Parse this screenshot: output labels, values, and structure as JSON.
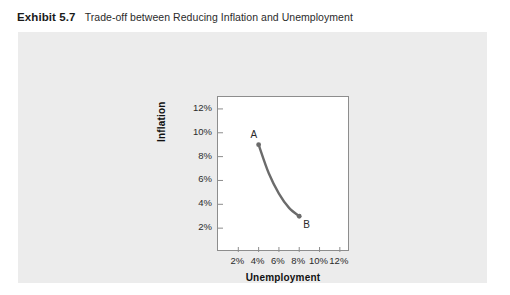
{
  "exhibit": {
    "label": "Exhibit 5.7",
    "caption": "Trade-off between Reducing Inflation and Unemployment"
  },
  "colors": {
    "panel_background": "#ececec",
    "plot_background": "#ffffff",
    "frame": "#8d8d8d",
    "curve": "#6b6b6b",
    "text": "#2b2b2b"
  },
  "chart_data": {
    "type": "line",
    "title": "",
    "subtitle": "",
    "xlabel": "Unemployment",
    "ylabel": "Inflation",
    "xlim": [
      0,
      13
    ],
    "ylim": [
      0,
      13
    ],
    "xticks": [
      2,
      4,
      6,
      8,
      10,
      12
    ],
    "xtick_labels": [
      "2%",
      "4%",
      "6%",
      "8%",
      "10%",
      "12%"
    ],
    "yticks": [
      2,
      4,
      6,
      8,
      10,
      12
    ],
    "ytick_labels": [
      "2%",
      "4%",
      "6%",
      "8%",
      "10%",
      "12%"
    ],
    "grid": false,
    "legend": "none",
    "series": [
      {
        "name": "Phillips curve",
        "color": "#6b6b6b",
        "x": [
          4,
          5,
          6,
          7,
          8
        ],
        "y": [
          9,
          6.6,
          4.9,
          3.7,
          3
        ]
      }
    ],
    "annotations": [
      {
        "label": "A",
        "x": 4,
        "y": 9,
        "marker": true,
        "label_position": "above-left"
      },
      {
        "label": "B",
        "x": 8,
        "y": 3,
        "marker": true,
        "label_position": "below-right"
      }
    ]
  }
}
